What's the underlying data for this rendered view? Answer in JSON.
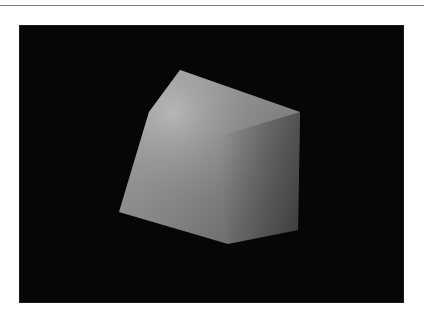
{
  "figure": {
    "background_color": "#060606",
    "object": {
      "type": "cube",
      "colors": {
        "highlight": "#b8b8b8",
        "mid": "#8e8e8e",
        "shadow": "#4a4a4a"
      }
    }
  }
}
